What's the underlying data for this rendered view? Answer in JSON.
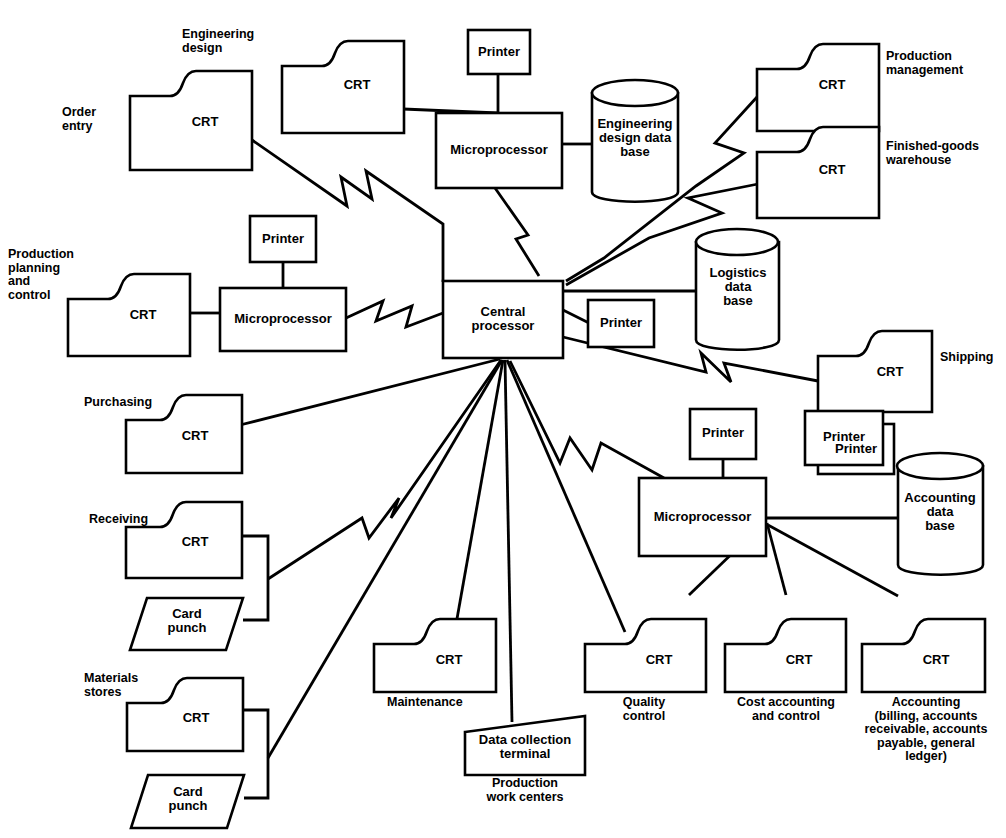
{
  "diagram": {
    "type": "network-block-diagram",
    "legend": {
      "crt_label": "CRT",
      "printer_label": "Printer",
      "microprocessor_label": "Microprocessor",
      "card_punch_label": "Card\npunch",
      "central_label": "Central\nprocessor"
    },
    "nodes": [
      {
        "id": "crt-order-entry",
        "kind": "crt",
        "inner": "CRT",
        "label": "Order\nentry",
        "label_pos": "left"
      },
      {
        "id": "crt-engineering-design",
        "kind": "crt",
        "inner": "CRT",
        "label": "Engineering\ndesign",
        "label_pos": "left"
      },
      {
        "id": "printer-engineering",
        "kind": "printer",
        "inner": "Printer",
        "label": "",
        "label_pos": "none"
      },
      {
        "id": "micro-engineering",
        "kind": "microprocessor",
        "inner": "Microprocessor",
        "label": "",
        "label_pos": "none"
      },
      {
        "id": "db-engineering-design",
        "kind": "database",
        "inner": "Engineering\ndesign data\nbase",
        "label": "",
        "label_pos": "none"
      },
      {
        "id": "crt-production-management",
        "kind": "crt",
        "inner": "CRT",
        "label": "Production\nmanagement",
        "label_pos": "right"
      },
      {
        "id": "crt-finished-goods",
        "kind": "crt",
        "inner": "CRT",
        "label": "Finished-goods\nwarehouse",
        "label_pos": "right"
      },
      {
        "id": "crt-production-planning",
        "kind": "crt",
        "inner": "CRT",
        "label": "Production\nplanning\nand\ncontrol",
        "label_pos": "left"
      },
      {
        "id": "printer-planning",
        "kind": "printer",
        "inner": "Printer",
        "label": "",
        "label_pos": "none"
      },
      {
        "id": "micro-planning",
        "kind": "microprocessor",
        "inner": "Microprocessor",
        "label": "",
        "label_pos": "none"
      },
      {
        "id": "central-processor",
        "kind": "central",
        "inner": "Central\nprocessor",
        "label": "",
        "label_pos": "none"
      },
      {
        "id": "printer-central",
        "kind": "printer",
        "inner": "Printer",
        "label": "",
        "label_pos": "none"
      },
      {
        "id": "db-logistics",
        "kind": "database",
        "inner": "Logistics\ndata\nbase",
        "label": "",
        "label_pos": "none"
      },
      {
        "id": "crt-shipping",
        "kind": "crt",
        "inner": "CRT",
        "label": "Shipping",
        "label_pos": "right"
      },
      {
        "id": "printer-shipping",
        "kind": "printer",
        "inner": "Printer",
        "label": "",
        "label_pos": "none"
      },
      {
        "id": "crt-purchasing",
        "kind": "crt",
        "inner": "CRT",
        "label": "Purchasing",
        "label_pos": "left"
      },
      {
        "id": "crt-receiving",
        "kind": "crt",
        "inner": "CRT",
        "label": "Receiving",
        "label_pos": "left"
      },
      {
        "id": "punch-receiving",
        "kind": "cardpunch",
        "inner": "Card\npunch",
        "label": "",
        "label_pos": "none"
      },
      {
        "id": "crt-materials-stores",
        "kind": "crt",
        "inner": "CRT",
        "label": "Materials\nstores",
        "label_pos": "left"
      },
      {
        "id": "punch-materials",
        "kind": "cardpunch",
        "inner": "Card\npunch",
        "label": "",
        "label_pos": "none"
      },
      {
        "id": "crt-maintenance",
        "kind": "crt",
        "inner": "CRT",
        "label": "Maintenance",
        "label_pos": "below"
      },
      {
        "id": "terminal-data-collection",
        "kind": "terminal",
        "inner": "Data collection\nterminal",
        "label": "Production\nwork centers",
        "label_pos": "below"
      },
      {
        "id": "crt-quality-control",
        "kind": "crt",
        "inner": "CRT",
        "label": "Quality\ncontrol",
        "label_pos": "below"
      },
      {
        "id": "crt-cost-accounting",
        "kind": "crt",
        "inner": "CRT",
        "label": "Cost accounting\nand control",
        "label_pos": "below"
      },
      {
        "id": "crt-accounting",
        "kind": "crt",
        "inner": "CRT",
        "label": "Accounting\n(billing, accounts\nreceivable, accounts\npayable, general\nledger)",
        "label_pos": "below"
      },
      {
        "id": "printer-accounting",
        "kind": "printer",
        "inner": "Printer",
        "label": "",
        "label_pos": "none"
      },
      {
        "id": "micro-accounting",
        "kind": "microprocessor",
        "inner": "Microprocessor",
        "label": "",
        "label_pos": "none"
      },
      {
        "id": "printer-accounting-2",
        "kind": "printer",
        "inner": "Printer",
        "label": "",
        "label_pos": "none"
      },
      {
        "id": "db-accounting",
        "kind": "database",
        "inner": "Accounting\ndata\nbase",
        "label": "",
        "label_pos": "none"
      }
    ],
    "links": [
      {
        "from": "crt-order-entry",
        "to": "central-processor",
        "style": "zigzag"
      },
      {
        "from": "crt-engineering-design",
        "to": "micro-engineering",
        "style": "straight"
      },
      {
        "from": "printer-engineering",
        "to": "micro-engineering",
        "style": "straight"
      },
      {
        "from": "micro-engineering",
        "to": "db-engineering-design",
        "style": "straight"
      },
      {
        "from": "micro-engineering",
        "to": "central-processor",
        "style": "zigzag"
      },
      {
        "from": "crt-production-management",
        "to": "central-processor",
        "style": "zigzag"
      },
      {
        "from": "crt-finished-goods",
        "to": "central-processor",
        "style": "zigzag"
      },
      {
        "from": "crt-production-planning",
        "to": "micro-planning",
        "style": "straight"
      },
      {
        "from": "printer-planning",
        "to": "micro-planning",
        "style": "straight"
      },
      {
        "from": "micro-planning",
        "to": "central-processor",
        "style": "zigzag"
      },
      {
        "from": "central-processor",
        "to": "printer-central",
        "style": "straight"
      },
      {
        "from": "central-processor",
        "to": "db-logistics",
        "style": "straight"
      },
      {
        "from": "central-processor",
        "to": "crt-shipping",
        "style": "zigzag"
      },
      {
        "from": "crt-shipping",
        "to": "printer-shipping",
        "style": "straight"
      },
      {
        "from": "crt-purchasing",
        "to": "central-processor",
        "style": "straight"
      },
      {
        "from": "crt-receiving",
        "to": "central-processor",
        "style": "zigzag"
      },
      {
        "from": "crt-receiving",
        "to": "punch-receiving",
        "style": "bracket"
      },
      {
        "from": "crt-materials-stores",
        "to": "central-processor",
        "style": "straight"
      },
      {
        "from": "crt-materials-stores",
        "to": "punch-materials",
        "style": "bracket"
      },
      {
        "from": "crt-maintenance",
        "to": "central-processor",
        "style": "straight"
      },
      {
        "from": "terminal-data-collection",
        "to": "central-processor",
        "style": "straight"
      },
      {
        "from": "crt-quality-control",
        "to": "central-processor",
        "style": "straight"
      },
      {
        "from": "central-processor",
        "to": "micro-accounting",
        "style": "zigzag"
      },
      {
        "from": "printer-accounting",
        "to": "micro-accounting",
        "style": "straight"
      },
      {
        "from": "micro-accounting",
        "to": "db-accounting",
        "style": "straight"
      },
      {
        "from": "micro-accounting",
        "to": "crt-quality-control",
        "style": "straight"
      },
      {
        "from": "micro-accounting",
        "to": "crt-cost-accounting",
        "style": "straight"
      },
      {
        "from": "micro-accounting",
        "to": "crt-accounting",
        "style": "straight"
      }
    ]
  },
  "labels": {
    "order_entry": "Order\nentry",
    "engineering_design": "Engineering\ndesign",
    "production_management": "Production\nmanagement",
    "finished_goods_warehouse": "Finished-goods\nwarehouse",
    "production_planning_and_control": "Production\nplanning\nand\ncontrol",
    "shipping": "Shipping",
    "purchasing": "Purchasing",
    "receiving": "Receiving",
    "materials_stores": "Materials\nstores",
    "maintenance": "Maintenance",
    "production_work_centers": "Production\nwork centers",
    "quality_control": "Quality\ncontrol",
    "cost_accounting_and_control": "Cost accounting\nand control",
    "accounting_full": "Accounting\n(billing, accounts\nreceivable, accounts\npayable, general\nledger)"
  },
  "inner_text": {
    "crt": "CRT",
    "printer": "Printer",
    "microprocessor": "Microprocessor",
    "central_processor": "Central\nprocessor",
    "card_punch": "Card\npunch",
    "engineering_design_data_base": "Engineering\ndesign data\nbase",
    "logistics_data_base": "Logistics\ndata\nbase",
    "accounting_data_base": "Accounting\ndata\nbase",
    "data_collection_terminal": "Data collection\nterminal"
  },
  "colors": {
    "ink": "#000000",
    "paper": "#ffffff"
  }
}
